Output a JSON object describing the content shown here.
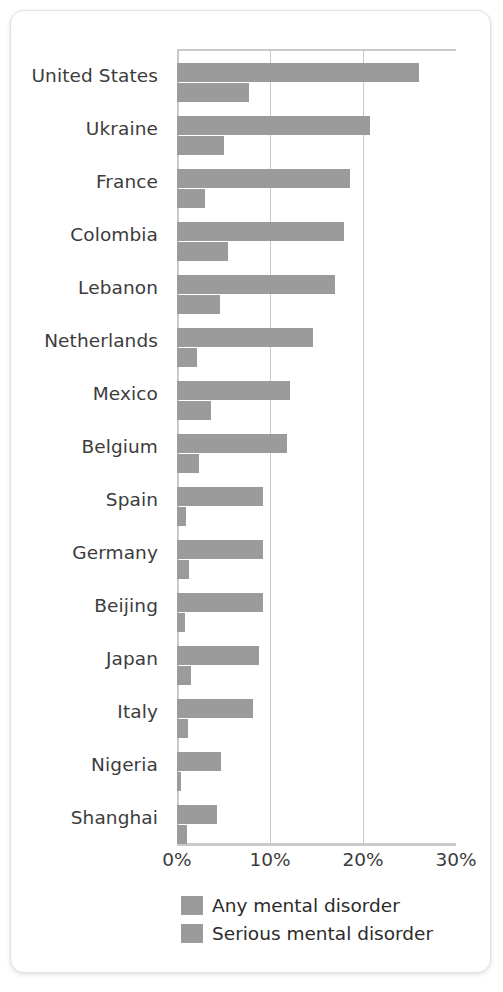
{
  "chart_data": {
    "type": "bar",
    "orientation": "horizontal",
    "title": "",
    "xlabel": "",
    "ylabel": "",
    "xlim": [
      0,
      30
    ],
    "xunit": "%",
    "grid": true,
    "gridlines": [
      0,
      10,
      20,
      30
    ],
    "xticklabels": [
      "0%",
      "10%",
      "20%",
      "30%"
    ],
    "legend_position": "bottom",
    "categories": [
      "United States",
      "Ukraine",
      "France",
      "Colombia",
      "Lebanon",
      "Netherlands",
      "Mexico",
      "Belgium",
      "Spain",
      "Germany",
      "Beijing",
      "Japan",
      "Italy",
      "Nigeria",
      "Shanghai"
    ],
    "series": [
      {
        "name": "Any mental disorder",
        "color": "#9b9b9b",
        "values": [
          26.0,
          20.8,
          18.6,
          18.0,
          17.0,
          14.6,
          12.2,
          11.8,
          9.3,
          9.3,
          9.2,
          8.8,
          8.2,
          4.7,
          4.3
        ]
      },
      {
        "name": "Serious mental disorder",
        "color": "#9b9b9b",
        "values": [
          7.7,
          5.0,
          3.0,
          5.5,
          4.6,
          2.2,
          3.7,
          2.4,
          1.0,
          1.3,
          0.9,
          1.5,
          1.2,
          0.4,
          1.1
        ]
      }
    ]
  },
  "legend": {
    "items": [
      {
        "label": "Any mental disorder"
      },
      {
        "label": "Serious mental disorder"
      }
    ]
  },
  "colors": {
    "bar": "#9b9b9b",
    "axis": "#c9c9c9",
    "text": "#3c3c3c",
    "card_background": "#ffffff"
  }
}
